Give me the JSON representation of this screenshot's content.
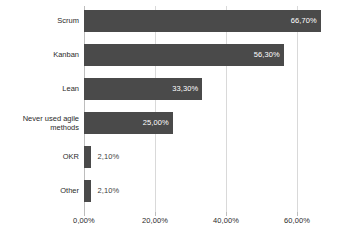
{
  "chart_data": {
    "type": "bar",
    "orientation": "horizontal",
    "title": "",
    "subtitle": "",
    "xlabel": "",
    "ylabel": "",
    "categories": [
      "Scrum",
      "Kanban",
      "Lean",
      "Never used agile\nmethods",
      "OKR",
      "Other"
    ],
    "values": [
      66.7,
      56.3,
      33.3,
      25.0,
      2.1,
      2.1
    ],
    "value_labels": [
      "66,70%",
      "56,30%",
      "33,30%",
      "25,00%",
      "2,10%",
      "2,10%"
    ],
    "label_placement": [
      "inside",
      "inside",
      "inside",
      "inside",
      "outside",
      "outside"
    ],
    "xlim": [
      0,
      70
    ],
    "xticks": [
      0,
      20,
      40,
      60
    ],
    "xtick_labels": [
      "0,00%",
      "20,00%",
      "40,00%",
      "60,00%"
    ],
    "grid": true,
    "grid_axis": "x",
    "legend": false,
    "legend_position": "none",
    "bar_color": "#4a4a4a",
    "grid_color": "#d9d9d9",
    "axis_color": "#bdbdbd",
    "background_color": "#ffffff",
    "inside_label_color": "#ffffff",
    "outside_label_color": "#3d3d3d"
  }
}
